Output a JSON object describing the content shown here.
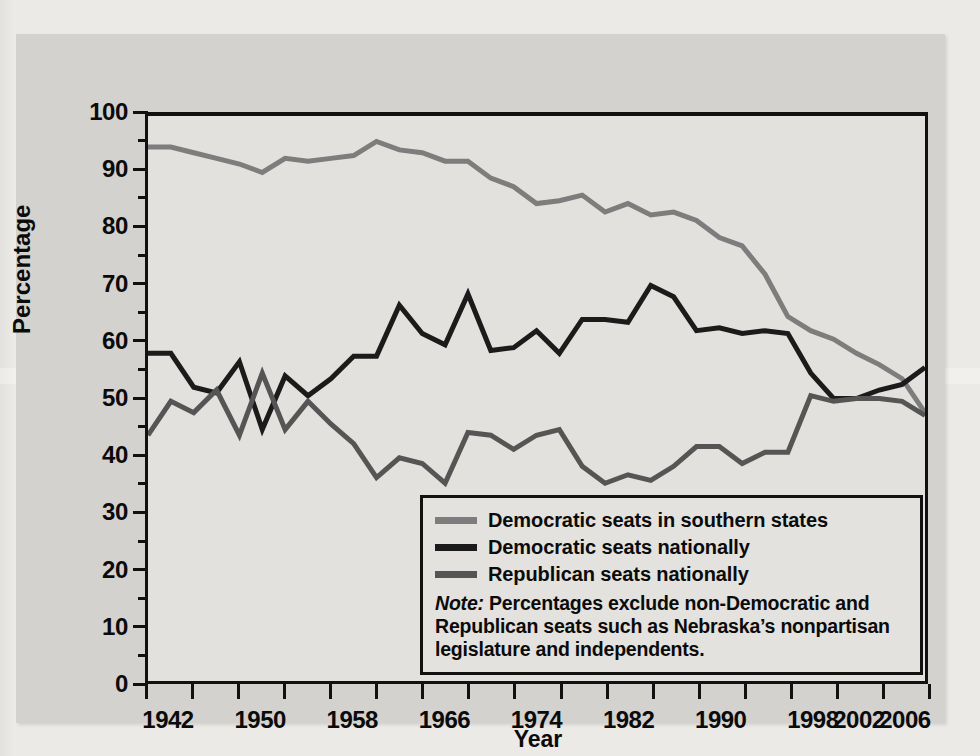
{
  "figure": {
    "background_color": "#d3d2cf",
    "plot_background_color": "#e2e1dd",
    "axis_color": "#111111"
  },
  "axes": {
    "y_title": "Percentage",
    "x_title": "Year",
    "y_ticks": [
      "0",
      "10",
      "20",
      "30",
      "40",
      "50",
      "60",
      "70",
      "80",
      "90",
      "100"
    ],
    "x_ticks": [
      "1942",
      "1950",
      "1958",
      "1966",
      "1974",
      "1982",
      "1990",
      "1998",
      "2002",
      "2006"
    ]
  },
  "legend": {
    "items": [
      {
        "label": "Democratic seats in southern states",
        "color": "#7d7d7d"
      },
      {
        "label": "Democratic seats nationally",
        "color": "#1b1b1b"
      },
      {
        "label": "Republican seats nationally",
        "color": "#555555"
      }
    ],
    "note_prefix": "Note:",
    "note_text": " Percentages exclude non-Democratic and Republican seats such as Nebraska’s nonpartisan legislature and independents."
  },
  "chart_data": {
    "type": "line",
    "title": "",
    "xlabel": "Year",
    "ylabel": "Percentage",
    "xlim": [
      1938,
      2006
    ],
    "ylim": [
      0,
      100
    ],
    "grid": false,
    "legend_position": "inside-bottom-right",
    "x": [
      1938,
      1940,
      1942,
      1944,
      1946,
      1948,
      1950,
      1952,
      1954,
      1956,
      1958,
      1960,
      1962,
      1964,
      1966,
      1968,
      1970,
      1972,
      1974,
      1976,
      1978,
      1980,
      1982,
      1984,
      1986,
      1988,
      1990,
      1992,
      1994,
      1996,
      1998,
      2000,
      2002,
      2004,
      2006
    ],
    "series": [
      {
        "name": "Democratic seats in southern states",
        "color": "#7d7d7d",
        "values": [
          94.5,
          94.5,
          93.5,
          92.5,
          91.5,
          90.0,
          92.5,
          92.0,
          92.5,
          93.0,
          95.5,
          94.0,
          93.5,
          92.0,
          92.0,
          89.0,
          87.5,
          84.5,
          85.0,
          86.0,
          83.0,
          84.5,
          82.5,
          83.0,
          81.5,
          78.5,
          77.0,
          72.0,
          64.5,
          62.0,
          60.5,
          58.0,
          56.0,
          53.5,
          47.5
        ]
      },
      {
        "name": "Democratic seats nationally",
        "color": "#1b1b1b",
        "values": [
          58.0,
          58.0,
          52.0,
          51.0,
          56.5,
          44.5,
          54.0,
          50.5,
          53.5,
          57.5,
          57.5,
          66.5,
          61.5,
          59.5,
          68.5,
          58.5,
          59.0,
          62.0,
          58.0,
          64.0,
          64.0,
          63.5,
          70.0,
          68.0,
          62.0,
          62.5,
          61.5,
          62.0,
          61.5,
          54.5,
          50.0,
          50.0,
          51.5,
          52.5,
          55.5
        ]
      },
      {
        "name": "Republican seats nationally",
        "color": "#555555",
        "values": [
          43.5,
          49.5,
          47.5,
          51.5,
          43.5,
          54.5,
          44.5,
          49.5,
          45.5,
          42.0,
          36.0,
          39.5,
          38.5,
          35.0,
          44.0,
          43.5,
          41.0,
          43.5,
          44.5,
          38.0,
          35.0,
          36.5,
          35.5,
          38.0,
          41.5,
          41.5,
          38.5,
          40.5,
          40.5,
          50.5,
          49.5,
          50.0,
          50.0,
          49.5,
          47.0
        ]
      }
    ]
  }
}
